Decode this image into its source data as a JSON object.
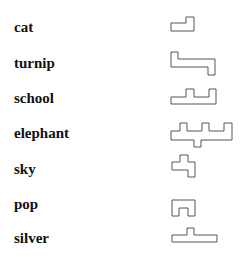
{
  "items": [
    {
      "word": "cat",
      "top": 18,
      "shape": "171,23 186,23 186,17 194,17 194,31 171,31"
    },
    {
      "word": "turnip",
      "top": 54,
      "shape": "171,52 178,52 178,59 215,59 215,75 208,75 208,67 171,67"
    },
    {
      "word": "school",
      "top": 89,
      "shape": "171,97 186,97 186,89 194,89 194,97 209,97 209,89 216,89 216,104 171,104"
    },
    {
      "word": "elephant",
      "top": 124,
      "shape": "171,131 180,131 180,123 187,123 187,131 202,131 202,123 209,123 209,131 224,131 224,123 232,123 232,140 201,140 201,147 194,147 194,140 171,140"
    },
    {
      "word": "sky",
      "top": 160,
      "shape": "180,155 188,155 188,162 195,162 195,177 188,177 188,170 172,170 172,162 180,162"
    },
    {
      "word": "pop",
      "top": 195,
      "shape": "172,200 195,200 195,216 188,216 188,208 179,208 179,216 172,216"
    },
    {
      "word": "silver",
      "top": 229,
      "shape": "172,235 187,235 187,228 194,228 194,235 217,235 217,242 172,242"
    }
  ],
  "colors": {
    "text": "#111111",
    "stroke": "#555555",
    "background": "#ffffff"
  }
}
